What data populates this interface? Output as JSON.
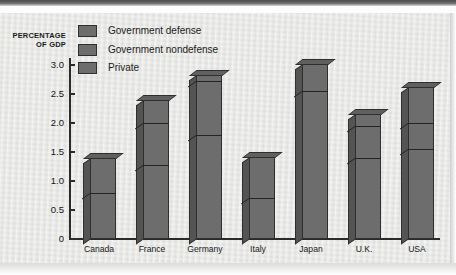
{
  "chart_data": {
    "type": "bar",
    "title": "",
    "subtitle": "",
    "stacked": true,
    "xlabel": "",
    "ylabel": "PERCENTAGE OF GDP",
    "ylabel_line1": "PERCENTAGE",
    "ylabel_line2": "OF GDP",
    "ylim": [
      0,
      3.2
    ],
    "yticks": [
      0,
      0.5,
      1.0,
      1.5,
      2.0,
      2.5,
      3.0
    ],
    "ytick_labels": [
      "0",
      "0.5",
      "1.0",
      "1.5",
      "2.0",
      "2.5",
      "3.0"
    ],
    "grid": false,
    "legend_position": "top-left",
    "categories": [
      "Canada",
      "France",
      "Germany",
      "Italy",
      "Japan",
      "U.K.",
      "USA"
    ],
    "series": [
      {
        "name": "Private",
        "color": "#6d6d6d",
        "values": [
          0.8,
          1.27,
          1.8,
          0.7,
          2.55,
          1.4,
          1.55
        ]
      },
      {
        "name": "Government nondefense",
        "color": "#6d6d6d",
        "values": [
          0.6,
          0.73,
          0.92,
          0.72,
          0.47,
          0.55,
          0.45
        ]
      },
      {
        "name": "Government defense",
        "color": "#6d6d6d",
        "values": [
          0.0,
          0.4,
          0.1,
          0.0,
          0.0,
          0.2,
          0.62
        ]
      }
    ],
    "totals": [
      1.4,
      2.4,
      2.82,
      1.42,
      3.02,
      2.15,
      2.62
    ],
    "legend": [
      {
        "label": "Government defense",
        "color": "#6d6d6d"
      },
      {
        "label": "Government nondefense",
        "color": "#6d6d6d"
      },
      {
        "label": "Private",
        "color": "#6d6d6d"
      }
    ]
  },
  "colors": {
    "bar_face": "#6d6d6d",
    "bar_side": "#545454",
    "bar_top": "#606060",
    "outline": "#2f2f2f",
    "axis": "#2b2b2b",
    "paper": "#e9e9e7",
    "text": "#1a1a1a"
  }
}
